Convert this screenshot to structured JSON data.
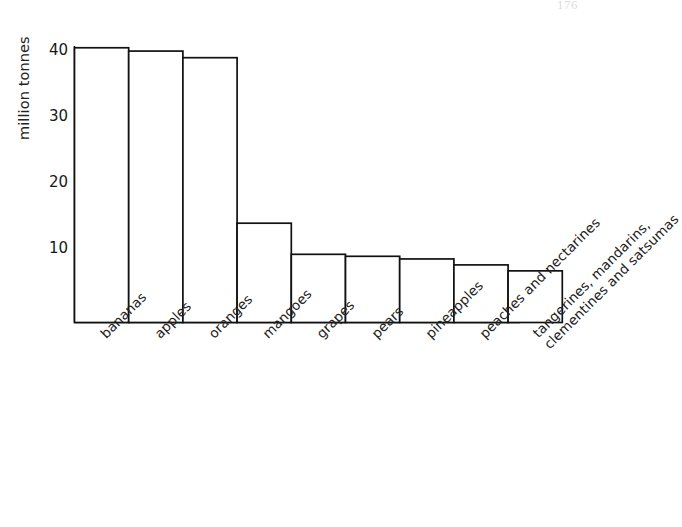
{
  "page": {
    "artifact_text": "176",
    "background_color": "#ffffff",
    "ink_color": "#1a1a1a"
  },
  "chart_data": {
    "type": "bar",
    "title": "",
    "xlabel": "",
    "ylabel": "million tonnes",
    "ylim": [
      0,
      45
    ],
    "grid": false,
    "legend": "none",
    "y_ticks": [
      10,
      20,
      30,
      40
    ],
    "categories": [
      "bananas",
      "apples",
      "oranges",
      "mangoes",
      "grapes",
      "pears",
      "pineapples",
      "peaches and nectarines",
      "tangerines, mandarins, clementines and satsumas"
    ],
    "category_label_lines": [
      [
        "bananas"
      ],
      [
        "apples"
      ],
      [
        "oranges"
      ],
      [
        "mangoes"
      ],
      [
        "grapes"
      ],
      [
        "pears"
      ],
      [
        "pineapples"
      ],
      [
        "peaches and nectarines"
      ],
      [
        "tangerines, mandarins,",
        "clementines and satsumas"
      ]
    ],
    "values": [
      41.5,
      41,
      40,
      15,
      10.3,
      10,
      9.6,
      8.7,
      7.8
    ],
    "units": "million tonnes",
    "bar_style": "outline",
    "bar_fill": "#ffffff",
    "bar_stroke": "#111111"
  }
}
